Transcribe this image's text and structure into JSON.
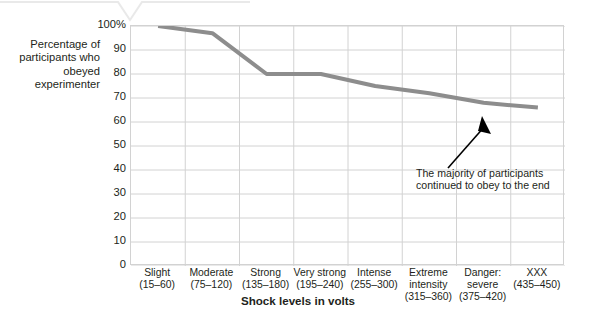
{
  "figure": {
    "y_axis_caption": "Percentage of participants who obeyed experimenter",
    "x_axis_title": "Shock levels in volts",
    "annotation": "The majority of participants continued to obey to the end",
    "line_color": "#8d8d8d",
    "grid_color": "#d2d2d2",
    "text_color": "#231f20",
    "background": "#ffffff"
  },
  "chart_data": {
    "type": "line",
    "title": "",
    "xlabel": "Shock levels in volts",
    "ylabel": "Percentage of participants who obeyed experimenter",
    "ylim": [
      0,
      100
    ],
    "ytick_labels": [
      "100%",
      "90",
      "80",
      "70",
      "60",
      "50",
      "40",
      "30",
      "20",
      "10",
      "0"
    ],
    "ytick_values": [
      100,
      90,
      80,
      70,
      60,
      50,
      40,
      30,
      20,
      10,
      0
    ],
    "grid": true,
    "legend": "none",
    "categories": [
      "Slight\n(15–60)",
      "Moderate\n(75–120)",
      "Strong\n(135–180)",
      "Very\nstrong\n(195–240)",
      "Intense\n(255–300)",
      "Extreme\nintensity\n(315–360)",
      "Danger:\nsevere\n(375–420)",
      "XXX\n(435–450)"
    ],
    "category_names": [
      "Slight",
      "Moderate",
      "Strong",
      "Very strong",
      "Intense",
      "Extreme intensity",
      "Danger: severe",
      "XXX"
    ],
    "category_ranges": [
      "(15–60)",
      "(75–120)",
      "(135–180)",
      "(195–240)",
      "(255–300)",
      "(315–360)",
      "(375–420)",
      "(435–450)"
    ],
    "values": [
      100,
      97,
      80,
      80,
      75,
      72,
      68,
      66
    ],
    "annotations": [
      {
        "text": "The majority of participants continued to obey to the end",
        "points_to_category": "XXX",
        "points_to_value": 66
      }
    ]
  },
  "y_ticks": [
    {
      "label": "100%",
      "value": 100
    },
    {
      "label": "90",
      "value": 90
    },
    {
      "label": "80",
      "value": 80
    },
    {
      "label": "70",
      "value": 70
    },
    {
      "label": "60",
      "value": 60
    },
    {
      "label": "50",
      "value": 50
    },
    {
      "label": "40",
      "value": 40
    },
    {
      "label": "30",
      "value": 30
    },
    {
      "label": "20",
      "value": 20
    },
    {
      "label": "10",
      "value": 10
    },
    {
      "label": "0",
      "value": 0
    }
  ],
  "x_ticks": [
    {
      "name": "Slight",
      "range": "(15–60)"
    },
    {
      "name": "Moderate",
      "range": "(75–120)"
    },
    {
      "name": "Strong",
      "range": "(135–180)"
    },
    {
      "name": "Very strong",
      "range": "(195–240)"
    },
    {
      "name": "Intense",
      "range": "(255–300)"
    },
    {
      "name": "Extreme intensity",
      "range": "(315–360)"
    },
    {
      "name": "Danger: severe",
      "range": "(375–420)"
    },
    {
      "name": "XXX",
      "range": "(435–450)"
    }
  ]
}
